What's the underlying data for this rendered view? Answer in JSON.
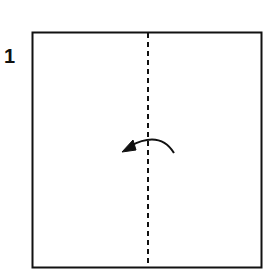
{
  "diagram": {
    "step_number": "1",
    "paper": {
      "shape": "square",
      "stroke": "#111111"
    },
    "fold_line": {
      "type": "valley-fold",
      "orientation": "vertical",
      "style": "dashed",
      "position": "center"
    },
    "arrow": {
      "direction": "right-to-left",
      "meaning": "fold right half over to the left",
      "icon": "curved-arrow-left"
    }
  }
}
